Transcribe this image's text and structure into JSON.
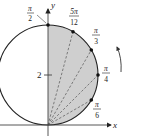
{
  "figure": {
    "type": "polar-circle-diagram",
    "equation_hint": "r = 4 sin θ",
    "axes": {
      "x_label": "x",
      "y_label": "y",
      "y_tick_label": "2"
    },
    "colors": {
      "shade": "#cfcfcf",
      "stroke": "#222222",
      "ray": "#555555"
    },
    "angle_labels": [
      {
        "id": "pi-over-2",
        "num": "π",
        "den": "2"
      },
      {
        "id": "5pi-over-12",
        "num": "5π",
        "den": "12"
      },
      {
        "id": "pi-over-3",
        "num": "π",
        "den": "3"
      },
      {
        "id": "pi-over-4",
        "num": "π",
        "den": "4"
      },
      {
        "id": "pi-over-6",
        "num": "π",
        "den": "6"
      }
    ],
    "rotation_arrow": "counterclockwise"
  }
}
